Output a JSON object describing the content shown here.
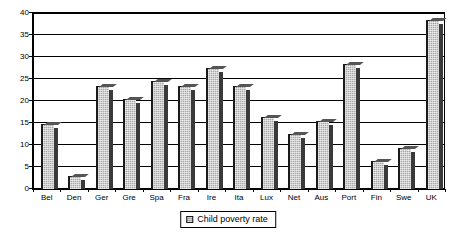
{
  "chart_data": {
    "type": "bar",
    "title": "",
    "xlabel": "",
    "ylabel": "",
    "ylim": [
      0,
      40
    ],
    "yticks": [
      0,
      5,
      10,
      15,
      20,
      25,
      30,
      35,
      40
    ],
    "grid": true,
    "legend_position": "bottom",
    "series_name": "Child poverty rate",
    "categories": [
      "Bel",
      "Den",
      "Ger",
      "Gre",
      "Spa",
      "Fra",
      "Ire",
      "Ita",
      "Lux",
      "Net",
      "Aus",
      "Port",
      "Fin",
      "Swe",
      "UK"
    ],
    "values": [
      14.8,
      3.0,
      23.5,
      20.5,
      24.5,
      23.5,
      27.5,
      23.5,
      16.4,
      12.4,
      15.4,
      28.4,
      6.4,
      9.4,
      38.5
    ],
    "series": [
      {
        "name": "Child poverty rate",
        "values": [
          14.8,
          3.0,
          23.5,
          20.5,
          24.5,
          23.5,
          27.5,
          23.5,
          16.4,
          12.4,
          15.4,
          28.4,
          6.4,
          9.4,
          38.5
        ]
      }
    ]
  },
  "legend": {
    "entries": [
      {
        "label": "Child poverty rate",
        "swatch_name": "legend-swatch-child-poverty-rate"
      }
    ]
  },
  "colors": {
    "bar_fill": "#a8a8a8",
    "bar_edge": "#1a1a1a",
    "bar_side": "#3a3a3a",
    "axis": "#000000",
    "background": "#ffffff"
  }
}
